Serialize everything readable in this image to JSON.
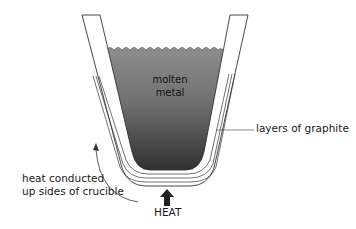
{
  "diagram": {
    "labels": {
      "molten_line1": "molten",
      "molten_line2": "metal",
      "graphite": "layers of graphite",
      "heat_conducted_line1": "heat conducted",
      "heat_conducted_line2": "up sides of crucible",
      "heat": "HEAT"
    },
    "colors": {
      "metal_top": "#8a8a8a",
      "metal_bottom": "#3a3a3a",
      "lines": "#333333",
      "arrow": "#222222"
    }
  }
}
